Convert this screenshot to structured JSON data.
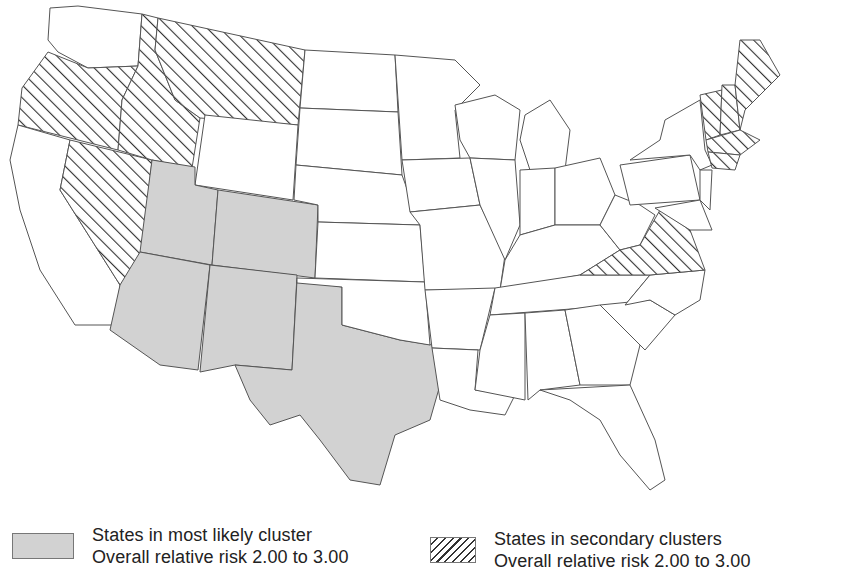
{
  "map": {
    "title": "",
    "colors": {
      "cluster_fill": "#d2d2d2",
      "border": "#555555",
      "background": "#ffffff",
      "hatch_line": "#333333"
    },
    "most_likely_cluster_states": [
      "Utah",
      "Colorado",
      "Arizona",
      "New Mexico",
      "Texas"
    ],
    "secondary_cluster_states": [
      "Oregon",
      "Idaho",
      "Montana",
      "Nevada",
      "Virginia",
      "Vermont",
      "New Hampshire",
      "Maine",
      "Massachusetts",
      "Connecticut",
      "Rhode Island"
    ]
  },
  "legend": {
    "items": [
      {
        "pattern": "solid-gray",
        "line1": "States in most likely cluster",
        "line2": "Overall relative risk 2.00 to 3.00"
      },
      {
        "pattern": "diagonal-hatch",
        "line1": "States in secondary clusters",
        "line2": "Overall relative risk 2.00 to 3.00"
      }
    ]
  }
}
